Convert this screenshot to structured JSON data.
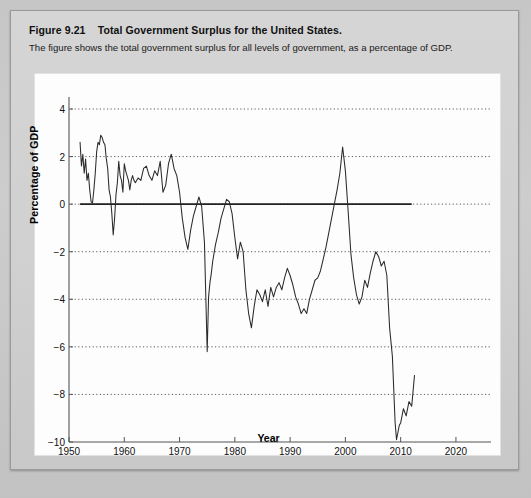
{
  "caption": {
    "figure_number": "Figure 9.21",
    "title": "Total Government Surplus for the United States.",
    "description": "The figure shows the total government surplus for all levels of government, as a percentage of GDP."
  },
  "chart_data": {
    "type": "line",
    "title": "Total Government Surplus for the United States.",
    "xlabel": "Year",
    "ylabel": "Percentage of GDP",
    "xlim": [
      1950,
      2022
    ],
    "ylim": [
      -10,
      4
    ],
    "xticks": [
      1950,
      1960,
      1970,
      1980,
      1990,
      2000,
      2010,
      2020
    ],
    "yticks": [
      4,
      2,
      0,
      -2,
      -4,
      -6,
      -8,
      -10
    ],
    "grid": "horizontal-dotted",
    "legend": "none",
    "zero_line": {
      "value": 0,
      "style": "solid",
      "from": 1952,
      "to": 2012
    },
    "line_color": "#2b2b2b",
    "grid_color": "#4a4a4a",
    "series": [
      {
        "name": "Total government surplus (% of GDP)",
        "x": [
          1952.0,
          1952.25,
          1952.5,
          1952.75,
          1953.0,
          1953.25,
          1953.5,
          1953.75,
          1954.0,
          1954.25,
          1954.5,
          1954.75,
          1955.0,
          1955.25,
          1955.5,
          1955.75,
          1956.0,
          1956.25,
          1956.5,
          1956.75,
          1957.0,
          1957.25,
          1957.5,
          1957.75,
          1958.0,
          1958.25,
          1958.5,
          1958.75,
          1959.0,
          1959.25,
          1959.5,
          1959.75,
          1960.0,
          1960.25,
          1960.5,
          1960.75,
          1961.0,
          1961.25,
          1961.5,
          1961.75,
          1962.0,
          1962.5,
          1963.0,
          1963.5,
          1964.0,
          1964.5,
          1965.0,
          1965.5,
          1966.0,
          1966.5,
          1967.0,
          1967.5,
          1968.0,
          1968.5,
          1969.0,
          1969.5,
          1970.0,
          1970.5,
          1971.0,
          1971.5,
          1972.0,
          1972.5,
          1973.0,
          1973.5,
          1974.0,
          1974.5,
          1975.0,
          1975.25,
          1975.5,
          1975.75,
          1976.0,
          1976.5,
          1977.0,
          1977.5,
          1978.0,
          1978.5,
          1979.0,
          1979.5,
          1980.0,
          1980.5,
          1981.0,
          1981.5,
          1982.0,
          1982.5,
          1983.0,
          1983.5,
          1984.0,
          1984.5,
          1985.0,
          1985.5,
          1986.0,
          1986.5,
          1987.0,
          1987.5,
          1988.0,
          1988.5,
          1989.0,
          1989.5,
          1990.0,
          1990.5,
          1991.0,
          1991.5,
          1992.0,
          1992.5,
          1993.0,
          1993.5,
          1994.0,
          1994.5,
          1995.0,
          1995.5,
          1996.0,
          1996.5,
          1997.0,
          1997.5,
          1998.0,
          1998.5,
          1999.0,
          1999.5,
          2000.0,
          2000.5,
          2001.0,
          2001.5,
          2002.0,
          2002.5,
          2003.0,
          2003.5,
          2004.0,
          2004.5,
          2005.0,
          2005.5,
          2006.0,
          2006.5,
          2007.0,
          2007.5,
          2008.0,
          2008.5,
          2009.0,
          2009.25,
          2009.5,
          2009.75,
          2010.0,
          2010.5,
          2011.0,
          2011.5,
          2012.0,
          2012.5
        ],
        "y": [
          2.6,
          1.6,
          2.1,
          1.3,
          1.9,
          1.0,
          1.3,
          0.6,
          0.1,
          0.05,
          0.6,
          1.3,
          2.2,
          2.6,
          2.5,
          2.9,
          2.8,
          2.6,
          2.5,
          1.9,
          1.5,
          0.6,
          0.3,
          -0.4,
          -1.3,
          -0.6,
          0.4,
          0.9,
          1.8,
          1.2,
          1.0,
          0.5,
          1.7,
          1.4,
          1.2,
          1.0,
          0.6,
          1.0,
          1.2,
          1.0,
          0.9,
          1.1,
          1.0,
          1.5,
          1.6,
          1.2,
          1.0,
          1.4,
          1.2,
          1.8,
          0.5,
          0.8,
          1.7,
          2.1,
          1.5,
          1.2,
          0.5,
          -0.6,
          -1.4,
          -1.9,
          -1.1,
          -0.5,
          -0.1,
          0.3,
          -0.1,
          -1.6,
          -6.2,
          -3.9,
          -3.3,
          -2.9,
          -2.4,
          -1.7,
          -1.2,
          -0.6,
          -0.2,
          0.2,
          0.1,
          -0.4,
          -1.4,
          -2.3,
          -1.6,
          -2.0,
          -3.6,
          -4.6,
          -5.2,
          -4.3,
          -3.6,
          -3.8,
          -4.1,
          -3.6,
          -4.3,
          -3.5,
          -3.9,
          -3.5,
          -3.3,
          -3.6,
          -3.1,
          -2.7,
          -3.0,
          -3.4,
          -3.9,
          -4.2,
          -4.6,
          -4.4,
          -4.6,
          -4.0,
          -3.6,
          -3.2,
          -3.1,
          -2.8,
          -2.3,
          -1.8,
          -1.2,
          -0.6,
          0.0,
          0.6,
          1.3,
          2.4,
          1.4,
          -0.3,
          -2.1,
          -3.1,
          -3.8,
          -4.2,
          -3.9,
          -3.2,
          -3.5,
          -2.9,
          -2.4,
          -2.0,
          -2.2,
          -2.6,
          -2.4,
          -3.0,
          -5.2,
          -6.4,
          -9.2,
          -9.9,
          -9.6,
          -9.3,
          -9.2,
          -8.6,
          -8.9,
          -8.3,
          -8.5,
          -7.2
        ]
      }
    ]
  },
  "axis": {
    "ylabel": "Percentage of GDP",
    "xlabel": "Year",
    "ytick_labels": [
      "4",
      "2",
      "0",
      "−2",
      "−4",
      "−6",
      "−8",
      "−10"
    ],
    "xtick_labels": [
      "1950",
      "1960",
      "1970",
      "1980",
      "1990",
      "2000",
      "2010",
      "2020"
    ]
  },
  "colors": {
    "page_background": "#c9c9c9",
    "card_background": "#d2d2d2",
    "panel_background": "#fdfdfd",
    "line": "#2b2b2b",
    "grid": "#4a4a4a",
    "text": "#111111"
  }
}
